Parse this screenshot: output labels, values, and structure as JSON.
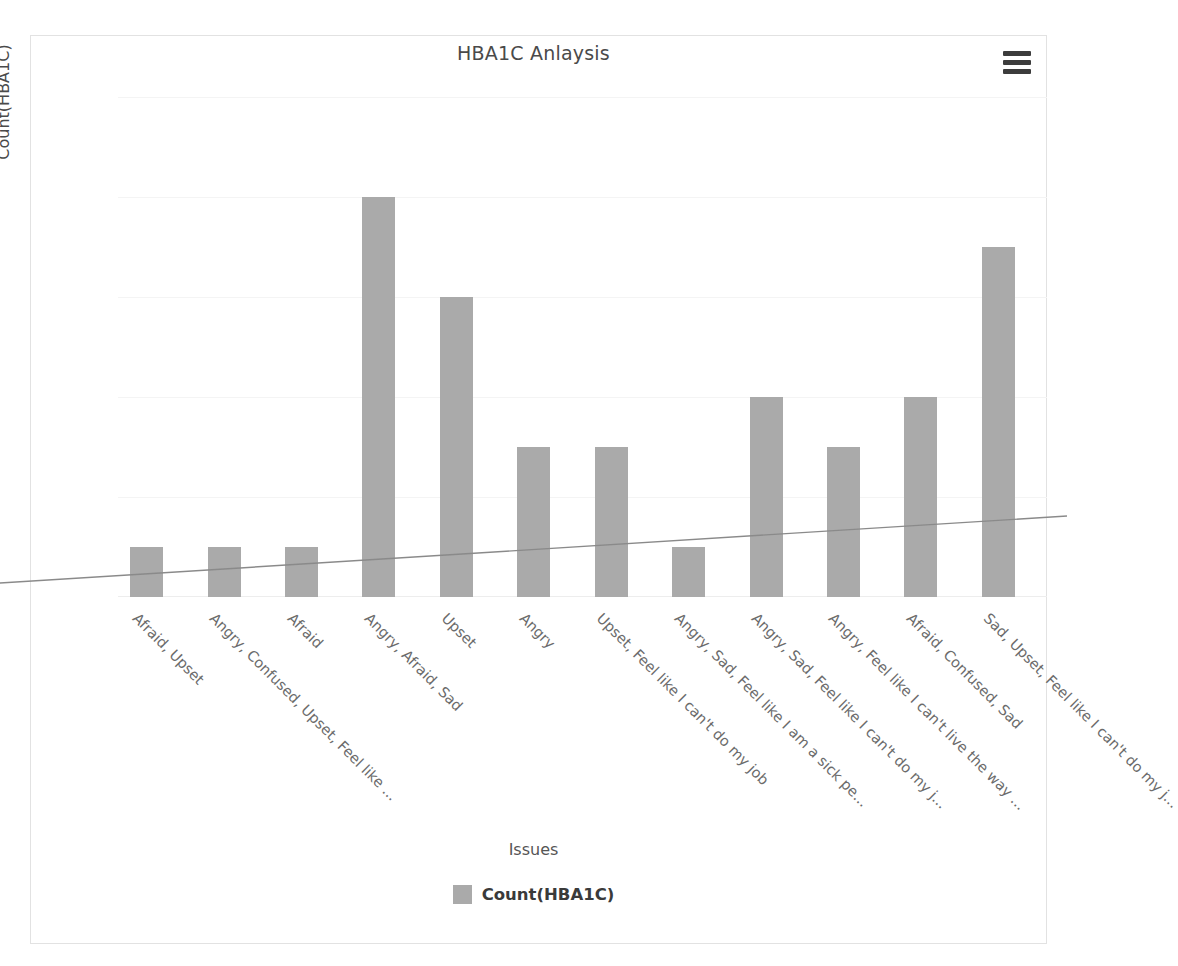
{
  "chart": {
    "title": "HBA1C Anlaysis",
    "menu_icon": "hamburger-menu-icon",
    "axis_title_x": "Issues",
    "axis_title_y": "Count(HBA1C)",
    "legend_label": "Count(HBA1C)",
    "bar_color": "#aaaaaa",
    "trendline_color": "#8a8a8a",
    "frame_color": "#e2e2e2"
  },
  "chart_data": {
    "type": "bar",
    "title": "HBA1C Anlaysis",
    "xlabel": "Issues",
    "ylabel": "Count(HBA1C)",
    "ylim": [
      0,
      10
    ],
    "yticks": [
      0,
      2,
      4,
      6,
      8,
      10
    ],
    "grid": true,
    "legend": [
      "Count(HBA1C)"
    ],
    "legend_position": "bottom-center",
    "categories": [
      "Afraid, Upset",
      "Angry, Confused, Upset, Feel like ...",
      "Afraid",
      "Angry, Afraid, Sad",
      "Upset",
      "Angry",
      "Upset, Feel like I can't do my job",
      "Angry, Sad, Feel like I am a sick pe...",
      "Angry, Sad, Feel like I can't do my j...",
      "Angry, Feel like I can't live the way ...",
      "Afraid, Confused, Sad",
      "Sad, Upset, Feel like I can't do my j..."
    ],
    "values": [
      1,
      1,
      1,
      8,
      6,
      3,
      3,
      1,
      4,
      3,
      4,
      7
    ],
    "series": [
      {
        "name": "Count(HBA1C)",
        "values": [
          1,
          1,
          1,
          8,
          6,
          3,
          3,
          1,
          4,
          3,
          4,
          7
        ]
      }
    ],
    "trendline": {
      "type": "linear",
      "y_at_left_edge": 0.28,
      "y_at_right_edge": 1.62
    }
  }
}
